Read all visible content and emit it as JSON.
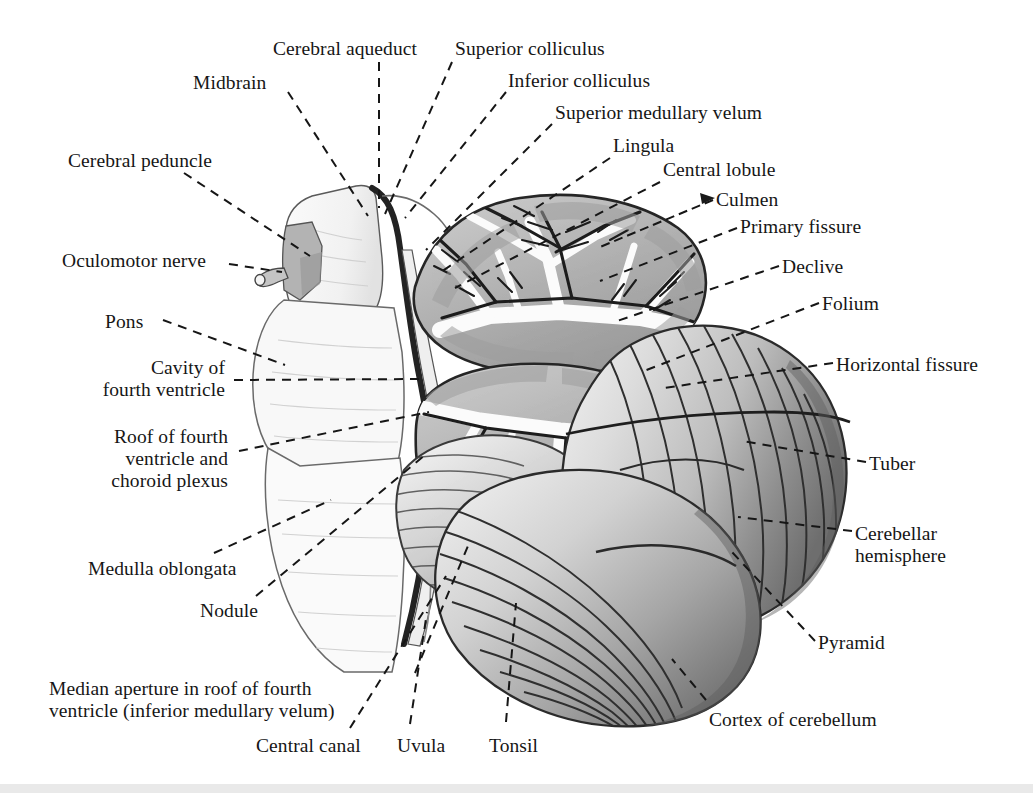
{
  "figure": {
    "background_color": "#ffffff",
    "ink_color": "#161616",
    "width": 1033,
    "height": 793
  },
  "labels": [
    {
      "id": "cerebral-aqueduct",
      "text": "Cerebral aqueduct",
      "x": 273,
      "y": 38,
      "align": "tl"
    },
    {
      "id": "superior-colliculus",
      "text": "Superior colliculus",
      "x": 455,
      "y": 38,
      "align": "tl"
    },
    {
      "id": "midbrain",
      "text": "Midbrain",
      "x": 193,
      "y": 72,
      "align": "tl"
    },
    {
      "id": "inferior-colliculus",
      "text": "Inferior colliculus",
      "x": 508,
      "y": 70,
      "align": "tl"
    },
    {
      "id": "superior-medullary-velum",
      "text": "Superior medullary velum",
      "x": 555,
      "y": 102,
      "align": "tl"
    },
    {
      "id": "lingula",
      "text": "Lingula",
      "x": 613,
      "y": 135,
      "align": "tl"
    },
    {
      "id": "cerebral-peduncle",
      "text": "Cerebral peduncle",
      "x": 68,
      "y": 150,
      "align": "tl"
    },
    {
      "id": "central-lobule",
      "text": "Central lobule",
      "x": 663,
      "y": 159,
      "align": "tl"
    },
    {
      "id": "culmen",
      "text": "Culmen",
      "x": 716,
      "y": 189,
      "align": "tl"
    },
    {
      "id": "primary-fissure",
      "text": "Primary fissure",
      "x": 740,
      "y": 216,
      "align": "tl"
    },
    {
      "id": "oculomotor-nerve",
      "text": "Oculomotor nerve",
      "x": 62,
      "y": 250,
      "align": "tl"
    },
    {
      "id": "declive",
      "text": "Declive",
      "x": 782,
      "y": 256,
      "align": "tl"
    },
    {
      "id": "folium",
      "text": "Folium",
      "x": 822,
      "y": 293,
      "align": "tl"
    },
    {
      "id": "pons",
      "text": "Pons",
      "x": 105,
      "y": 311,
      "align": "tl"
    },
    {
      "id": "horizontal-fissure",
      "text": "Horizontal fissure",
      "x": 836,
      "y": 354,
      "align": "tl"
    },
    {
      "id": "cavity-of-fourth-ventricle",
      "text": "Cavity of\nfourth ventricle",
      "x": 225,
      "y": 357,
      "align": "right-al"
    },
    {
      "id": "roof-of-fourth-ventricle",
      "text": "Roof of fourth\nventricle and\nchoroid plexus",
      "x": 228,
      "y": 426,
      "align": "right-al"
    },
    {
      "id": "tuber",
      "text": "Tuber",
      "x": 869,
      "y": 453,
      "align": "tl"
    },
    {
      "id": "cerebellar-hemisphere",
      "text": "Cerebellar\nhemisphere",
      "x": 855,
      "y": 523,
      "align": "tl"
    },
    {
      "id": "medulla-oblongata",
      "text": "Medulla oblongata",
      "x": 88,
      "y": 558,
      "align": "tl"
    },
    {
      "id": "nodule",
      "text": "Nodule",
      "x": 200,
      "y": 600,
      "align": "tl"
    },
    {
      "id": "pyramid",
      "text": "Pyramid",
      "x": 818,
      "y": 632,
      "align": "tl"
    },
    {
      "id": "median-aperture",
      "text": "Median aperture in roof of fourth\nventricle (inferior medullary velum)",
      "x": 49,
      "y": 678,
      "align": "tl"
    },
    {
      "id": "cortex-of-cerebellum",
      "text": "Cortex of cerebellum",
      "x": 709,
      "y": 709,
      "align": "tl"
    },
    {
      "id": "central-canal",
      "text": "Central canal",
      "x": 256,
      "y": 735,
      "align": "tl"
    },
    {
      "id": "uvula",
      "text": "Uvula",
      "x": 397,
      "y": 735,
      "align": "tl"
    },
    {
      "id": "tonsil",
      "text": "Tonsil",
      "x": 489,
      "y": 735,
      "align": "tl"
    }
  ],
  "leader_lines": [
    {
      "id": "leader-cerebral-aqueduct",
      "points": "379,62 379,208",
      "style": "dashed"
    },
    {
      "id": "leader-superior-colliculus",
      "points": "452,62 385,214",
      "style": "dashed"
    },
    {
      "id": "leader-midbrain",
      "points": "288,92 368,216",
      "style": "dashed"
    },
    {
      "id": "leader-inferior-colliculus",
      "points": "506,92 405,218",
      "style": "dashed"
    },
    {
      "id": "leader-superior-medullary-velum",
      "points": "552,124 426,250",
      "style": "dashed"
    },
    {
      "id": "leader-lingula",
      "points": "610,158 441,272",
      "style": "dashed"
    },
    {
      "id": "leader-cerebral-peduncle",
      "points": "184,173 310,256",
      "style": "dashed"
    },
    {
      "id": "leader-central-lobule",
      "points": "660,182 455,288",
      "style": "dashed"
    },
    {
      "id": "leader-culmen",
      "points": "713,200 600,247",
      "style": "arrow"
    },
    {
      "id": "leader-primary-fissure",
      "points": "737,228 600,281",
      "style": "dashed"
    },
    {
      "id": "leader-oculomotor-nerve",
      "points": "229,264 282,272",
      "style": "dashed"
    },
    {
      "id": "leader-declive",
      "points": "779,266 617,321",
      "style": "dashed"
    },
    {
      "id": "leader-folium",
      "points": "819,303 644,371",
      "style": "dashed"
    },
    {
      "id": "leader-pons",
      "points": "163,320 285,365",
      "style": "dashed"
    },
    {
      "id": "leader-horizontal-fissure",
      "points": "833,363 664,388",
      "style": "dashed"
    },
    {
      "id": "leader-cavity-of-fourth-ventricle",
      "points": "234,380 423,379",
      "style": "dashed"
    },
    {
      "id": "leader-roof-of-fourth-ventricle",
      "points": "239,451 429,412",
      "style": "dashed"
    },
    {
      "id": "leader-tuber",
      "points": "866,462 742,441",
      "style": "dashed"
    },
    {
      "id": "leader-cerebellar-hemisphere",
      "points": "852,531 738,517",
      "style": "dashed"
    },
    {
      "id": "leader-medulla-oblongata",
      "points": "214,553 331,500",
      "style": "dashed"
    },
    {
      "id": "leader-nodule",
      "points": "256,596 425,455",
      "style": "dashed"
    },
    {
      "id": "leader-pyramid",
      "points": "815,641 731,551",
      "style": "dashed"
    },
    {
      "id": "leader-median-aperture",
      "points": "415,673 470,541",
      "style": "dashed"
    },
    {
      "id": "leader-cortex-of-cerebellum",
      "points": "706,700 672,659",
      "style": "dashed"
    },
    {
      "id": "leader-central-canal",
      "points": "350,728 446,576",
      "style": "dashed"
    },
    {
      "id": "leader-uvula",
      "points": "410,724 427,612",
      "style": "dashed"
    },
    {
      "id": "leader-tonsil",
      "points": "506,722 516,603",
      "style": "dashed"
    }
  ],
  "structures": {
    "brainstem": {
      "name": "brainstem-outline",
      "shade": "#f4f4f4"
    },
    "midbrain": {
      "name": "midbrain-block",
      "shade": "#efefef"
    },
    "cerebral_peduncle": {
      "name": "cerebral-peduncle",
      "shade": "#bdbdbd"
    },
    "oculomotor_nerve": {
      "name": "oculomotor-nerve",
      "shade": "#a8a8a8"
    },
    "pons": {
      "name": "pons",
      "shade": "#f6f6f6"
    },
    "medulla": {
      "name": "medulla-oblongata",
      "shade": "#f7f7f7"
    },
    "fourth_ventricle": {
      "name": "fourth-ventricle-cavity",
      "shade": "#ffffff"
    },
    "vermis": {
      "name": "cerebellar-vermis-arbor-vitae",
      "shade": "#b9b9b9"
    },
    "hemisphere": {
      "name": "cerebellar-hemisphere",
      "shade": "#c9c9c9"
    },
    "tonsil": {
      "name": "cerebellar-tonsil",
      "shade": "#d4d4d4"
    }
  }
}
